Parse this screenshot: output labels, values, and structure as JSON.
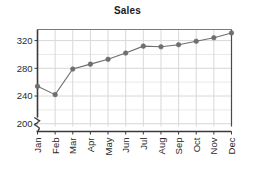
{
  "chart_data": {
    "type": "line",
    "title": "Sales",
    "xlabel": "",
    "ylabel": "",
    "categories": [
      "Jan",
      "Feb",
      "Mar",
      "Apr",
      "May",
      "Jun",
      "Jul",
      "Aug",
      "Sep",
      "Oct",
      "Nov",
      "Dec"
    ],
    "values": [
      254,
      242,
      279,
      286,
      293,
      302,
      312,
      311,
      314,
      319,
      324,
      331
    ],
    "ytick_labels": [
      "200",
      "240",
      "280",
      "320"
    ],
    "yticks": [
      200,
      240,
      280,
      320
    ],
    "ylim": [
      196,
      336
    ],
    "grid": true,
    "legend": "none",
    "axis_break": true,
    "axis_break_symbol": "zigzag",
    "marker": "circle",
    "series_color": "#6e6e6e",
    "grid_color": "#d8d8d8",
    "axis_color": "#4a4a4a",
    "text_color": "#2b2b2b"
  }
}
